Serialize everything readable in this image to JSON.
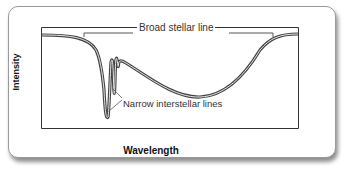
{
  "diagram": {
    "title": "",
    "axes": {
      "x_label": "Wavelength",
      "y_label": "Intensity"
    },
    "annotations": {
      "broad": "Broad stellar line",
      "narrow": "Narrow interstellar lines"
    },
    "colors": {
      "curve": "#555555",
      "frame": "#333333",
      "card_border": "#9a9a9a"
    }
  }
}
